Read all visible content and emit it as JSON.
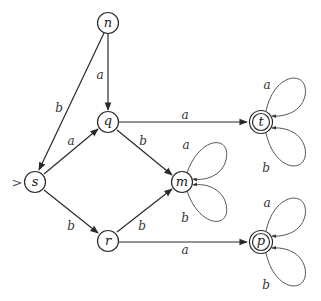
{
  "diagram": {
    "type": "finite-automaton",
    "start_marker": ">",
    "nodes": [
      {
        "id": "n",
        "label": "n",
        "accepting": false
      },
      {
        "id": "q",
        "label": "q",
        "accepting": false
      },
      {
        "id": "s",
        "label": "s",
        "accepting": false,
        "start": true
      },
      {
        "id": "m",
        "label": "m",
        "accepting": false
      },
      {
        "id": "r",
        "label": "r",
        "accepting": false
      },
      {
        "id": "t",
        "label": "t",
        "accepting": true
      },
      {
        "id": "p",
        "label": "p",
        "accepting": true
      }
    ],
    "edges": [
      {
        "from": "n",
        "to": "q",
        "label": "a"
      },
      {
        "from": "n",
        "to": "s",
        "label": "b"
      },
      {
        "from": "s",
        "to": "q",
        "label": "a"
      },
      {
        "from": "s",
        "to": "r",
        "label": "b"
      },
      {
        "from": "q",
        "to": "t",
        "label": "a"
      },
      {
        "from": "q",
        "to": "m",
        "label": "b"
      },
      {
        "from": "r",
        "to": "m",
        "label": "b"
      },
      {
        "from": "r",
        "to": "p",
        "label": "a"
      },
      {
        "from": "m",
        "to": "m",
        "label": "a"
      },
      {
        "from": "m",
        "to": "m",
        "label": "b"
      },
      {
        "from": "t",
        "to": "t",
        "label": "a"
      },
      {
        "from": "t",
        "to": "t",
        "label": "b"
      },
      {
        "from": "p",
        "to": "p",
        "label": "a"
      },
      {
        "from": "p",
        "to": "p",
        "label": "b"
      }
    ]
  }
}
